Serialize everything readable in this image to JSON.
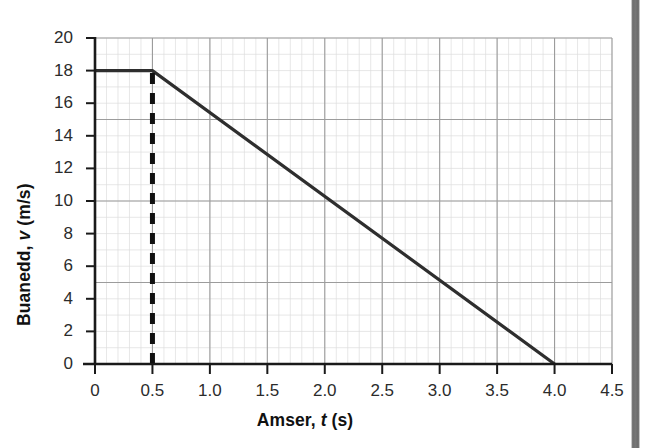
{
  "chart_data": {
    "type": "line",
    "title": "",
    "xlabel": "Amser, t (s)",
    "ylabel": "Buanedd, v (m/s)",
    "xlabel_parts": {
      "prefix": "Amser, ",
      "italic": "t",
      "suffix": " (s)"
    },
    "ylabel_parts": {
      "prefix": "Buanedd, ",
      "italic": "v",
      "suffix": " (m/s)"
    },
    "xlim": [
      0,
      4.5
    ],
    "ylim": [
      0,
      20
    ],
    "xticks": [
      0,
      0.5,
      1.0,
      1.5,
      2.0,
      2.5,
      3.0,
      3.5,
      4.0,
      4.5
    ],
    "xtick_labels": [
      "0",
      "0.5",
      "1.0",
      "1.5",
      "2.0",
      "2.5",
      "3.0",
      "3.5",
      "4.0",
      "4.5"
    ],
    "yticks": [
      0,
      2,
      4,
      6,
      8,
      10,
      12,
      14,
      16,
      18,
      20
    ],
    "ytick_labels": [
      "0",
      "2",
      "4",
      "6",
      "8",
      "10",
      "12",
      "14",
      "16",
      "18",
      "20"
    ],
    "grid": true,
    "grid_major_x_step": 0.5,
    "grid_major_y_step": 5,
    "grid_minor_x_step": 0.1,
    "grid_minor_y_step": 1,
    "legend": null,
    "series": [
      {
        "name": "velocity",
        "style": "solid",
        "color": "#2e2e2e",
        "x": [
          0,
          0.5,
          4.0
        ],
        "y": [
          18,
          18,
          0
        ],
        "points": [
          {
            "t": 0,
            "v": 18
          },
          {
            "t": 0.5,
            "v": 18
          },
          {
            "t": 4.0,
            "v": 0
          }
        ]
      },
      {
        "name": "dashed-marker-line",
        "style": "dashed",
        "color": "#111111",
        "x": [
          0.5,
          0.5
        ],
        "y": [
          0,
          18
        ],
        "points": [
          {
            "t": 0.5,
            "v": 0
          },
          {
            "t": 0.5,
            "v": 18
          }
        ]
      }
    ],
    "annotations": [
      {
        "label": "constant speed phase",
        "t_from": 0,
        "t_to": 0.5,
        "v": 18
      },
      {
        "label": "deceleration phase",
        "t_from": 0.5,
        "t_to": 4.0,
        "v_from": 18,
        "v_to": 0
      }
    ],
    "colors": {
      "line": "#2e2e2e",
      "dashed": "#111111",
      "axis": "#1a1a1a",
      "grid_major": "#9a9a9a",
      "grid_minor": "#d8d8d8",
      "tick_text": "#2b2b2b",
      "label_text": "#111111",
      "background": "#ffffff",
      "page_edge": "#6e6e6e"
    }
  }
}
